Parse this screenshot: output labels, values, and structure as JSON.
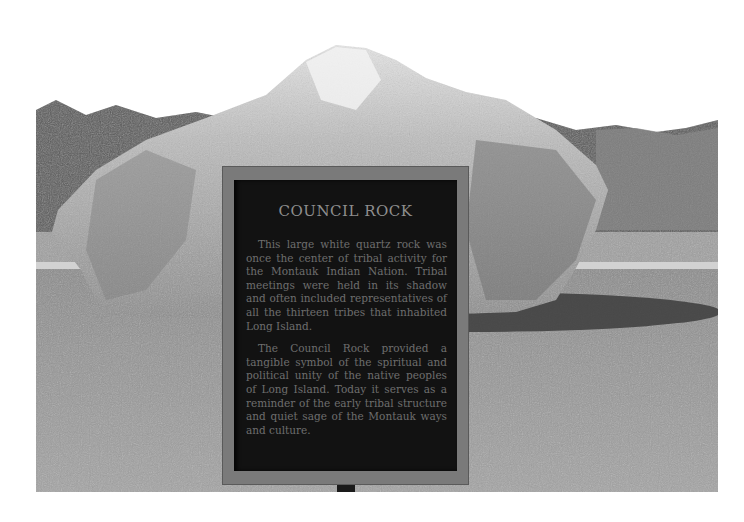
{
  "photo": {
    "subject": "Council Rock boulder with historical marker",
    "colors": {
      "sky": "#ffffff",
      "trees": "#4a4a4a",
      "grass": "#9a9a9a",
      "rock": "#a8a8a8",
      "rock_highlight": "#d8d8d8",
      "shadow": "#3a3a3a",
      "sign_frame": "#7a7a7a",
      "sign_panel": "#121212"
    }
  },
  "sign": {
    "title": "COUNCIL ROCK",
    "paragraphs": [
      "This large white quartz rock was once the center of tribal activity for the Montauk Indian Nation. Tribal meetings were held in its shadow and often included representatives of all the thirteen tribes that inhabited Long Island.",
      "The Council Rock provided a tangible symbol of the spiritual and political unity of the native peoples of Long Island. Today it serves as a reminder of the early tribal structure and quiet sage of the Montauk ways and culture."
    ]
  }
}
